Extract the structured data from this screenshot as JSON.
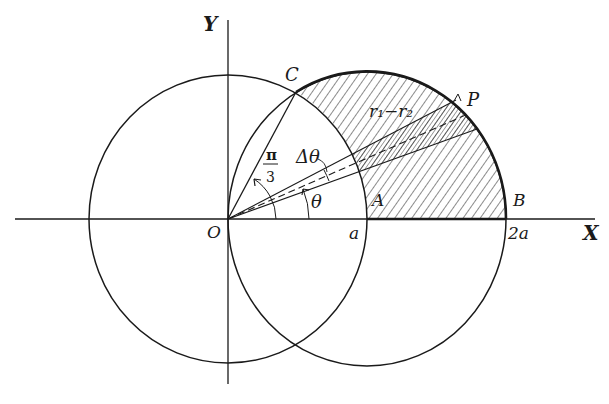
{
  "figure": {
    "colors": {
      "ink": "#1a1a1a",
      "background": "#ffffff"
    }
  },
  "axes": {
    "x_label": "X",
    "y_label": "Y",
    "origin_label": "O"
  },
  "points": {
    "C": "C",
    "P": "P",
    "A": "A",
    "B": "B"
  },
  "ticks": {
    "a": "a",
    "two_a": "2a"
  },
  "angles": {
    "pi_over_3_num": "π",
    "pi_over_3_den": "3",
    "theta": "θ",
    "delta_theta": "Δθ"
  },
  "annotations": {
    "r1_minus_r2": "r₁−r₂"
  },
  "curves": [
    {
      "name": "circle-r-equals-a",
      "center": "O",
      "radius": "a"
    },
    {
      "name": "circle-r-equals-2a-cos-theta",
      "center": "(a,0)",
      "radius": "a"
    }
  ],
  "shaded_region": "Region inside r = 2a cos θ and outside r = a, above X-axis, from θ = 0 to θ = π/3"
}
